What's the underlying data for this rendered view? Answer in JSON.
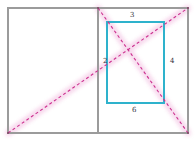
{
  "figure": {
    "canvas": {
      "width": 196,
      "height": 144,
      "background": "#ffffff"
    },
    "colors": {
      "outer_frame": "#9b9b9b",
      "divider": "#9b9b9b",
      "inner_rectangle": "#2eb2cc",
      "diagonal_line": "#cc2f8f",
      "diagonal_glow": "#f6d3ea",
      "label_text": "#33313a"
    },
    "outer_frame": {
      "name": "outer-rectangle",
      "x1": 8,
      "y1": 8,
      "x2": 188,
      "y2": 133,
      "stroke_width": 1.1
    },
    "divider": {
      "name": "vertical-divider",
      "x": 98,
      "y1": 8,
      "y2": 133,
      "stroke_width": 1.1
    },
    "inner_rectangle": {
      "name": "inner-rectangle",
      "x1": 107,
      "y1": 22,
      "x2": 164,
      "y2": 103,
      "stroke_width": 2.1
    },
    "diagonals": [
      {
        "name": "diagonal-main",
        "x1": 8,
        "y1": 133,
        "x2": 188,
        "y2": 8,
        "style": "dashed",
        "stroke_width": 1.1,
        "dash": "3 2.6"
      },
      {
        "name": "diagonal-secondary",
        "x1": 98,
        "y1": 8,
        "x2": 188,
        "y2": 133,
        "style": "dashed",
        "stroke_width": 1.1,
        "dash": "3 2.6"
      }
    ],
    "labels": [
      {
        "id": "label-top",
        "text": "3",
        "x": 130,
        "y": 12,
        "side": "top"
      },
      {
        "id": "label-left",
        "text": "2",
        "x": 103,
        "y": 58,
        "side": "left"
      },
      {
        "id": "label-right",
        "text": "4",
        "x": 170,
        "y": 58,
        "side": "right"
      },
      {
        "id": "label-bottom",
        "text": "6",
        "x": 132,
        "y": 107,
        "side": "bottom"
      }
    ]
  }
}
